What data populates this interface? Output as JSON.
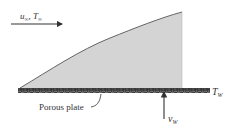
{
  "diagram": {
    "freestream_label": {
      "u": "u",
      "u_sub": "∞",
      "sep": ", ",
      "t": "T",
      "t_sub": "∞"
    },
    "wall_temp_label": {
      "main": "T",
      "sub": "W"
    },
    "wall_velocity_label": {
      "main": "v",
      "sub": "W"
    },
    "plate_label": "Porous plate",
    "colors": {
      "boundary_layer_fill": "#d4d4d4",
      "boundary_layer_edge": "#555555",
      "plate": "#3a3a3a",
      "arrow": "#333333",
      "text": "#333333"
    }
  }
}
